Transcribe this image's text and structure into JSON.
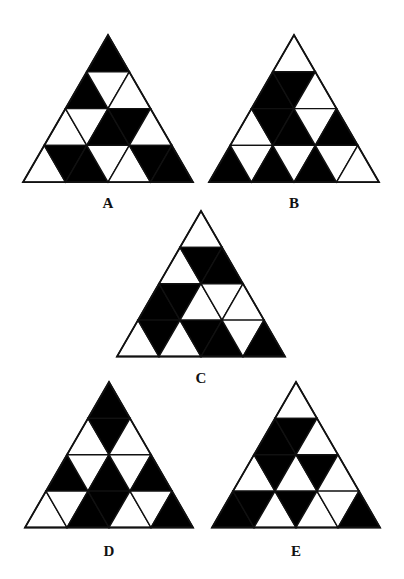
{
  "figures": [
    {
      "label": "A",
      "apex": [
        108,
        35
      ],
      "side": 170,
      "label_pos": [
        108,
        205
      ],
      "cells": [
        {
          "r": 0,
          "i": 0,
          "b": 1
        },
        {
          "r": 1,
          "i": 0,
          "b": 1
        },
        {
          "r": 1,
          "i": 1,
          "b": 0
        },
        {
          "r": 1,
          "i": 2,
          "b": 0
        },
        {
          "r": 2,
          "i": 0,
          "b": 0
        },
        {
          "r": 2,
          "i": 1,
          "b": 0
        },
        {
          "r": 2,
          "i": 2,
          "b": 1
        },
        {
          "r": 2,
          "i": 3,
          "b": 1
        },
        {
          "r": 2,
          "i": 4,
          "b": 0
        },
        {
          "r": 3,
          "i": 0,
          "b": 0
        },
        {
          "r": 3,
          "i": 1,
          "b": 1
        },
        {
          "r": 3,
          "i": 2,
          "b": 1
        },
        {
          "r": 3,
          "i": 3,
          "b": 0
        },
        {
          "r": 3,
          "i": 4,
          "b": 0
        },
        {
          "r": 3,
          "i": 5,
          "b": 1
        },
        {
          "r": 3,
          "i": 6,
          "b": 1
        }
      ]
    },
    {
      "label": "B",
      "apex": [
        294,
        35
      ],
      "side": 170,
      "label_pos": [
        294,
        205
      ],
      "cells": [
        {
          "r": 0,
          "i": 0,
          "b": 0
        },
        {
          "r": 1,
          "i": 0,
          "b": 1
        },
        {
          "r": 1,
          "i": 1,
          "b": 1
        },
        {
          "r": 1,
          "i": 2,
          "b": 0
        },
        {
          "r": 2,
          "i": 0,
          "b": 0
        },
        {
          "r": 2,
          "i": 1,
          "b": 1
        },
        {
          "r": 2,
          "i": 2,
          "b": 1
        },
        {
          "r": 2,
          "i": 3,
          "b": 0
        },
        {
          "r": 2,
          "i": 4,
          "b": 1
        },
        {
          "r": 3,
          "i": 0,
          "b": 1
        },
        {
          "r": 3,
          "i": 1,
          "b": 0
        },
        {
          "r": 3,
          "i": 2,
          "b": 1
        },
        {
          "r": 3,
          "i": 3,
          "b": 0
        },
        {
          "r": 3,
          "i": 4,
          "b": 1
        },
        {
          "r": 3,
          "i": 5,
          "b": 0
        },
        {
          "r": 3,
          "i": 6,
          "b": 0
        }
      ]
    },
    {
      "label": "C",
      "apex": [
        201,
        211
      ],
      "side": 168,
      "label_pos": [
        201,
        380
      ],
      "cells": [
        {
          "r": 0,
          "i": 0,
          "b": 0
        },
        {
          "r": 1,
          "i": 0,
          "b": 0
        },
        {
          "r": 1,
          "i": 1,
          "b": 1
        },
        {
          "r": 1,
          "i": 2,
          "b": 1
        },
        {
          "r": 2,
          "i": 0,
          "b": 1
        },
        {
          "r": 2,
          "i": 1,
          "b": 1
        },
        {
          "r": 2,
          "i": 2,
          "b": 0
        },
        {
          "r": 2,
          "i": 3,
          "b": 0
        },
        {
          "r": 2,
          "i": 4,
          "b": 0
        },
        {
          "r": 3,
          "i": 0,
          "b": 0
        },
        {
          "r": 3,
          "i": 1,
          "b": 1
        },
        {
          "r": 3,
          "i": 2,
          "b": 0
        },
        {
          "r": 3,
          "i": 3,
          "b": 1
        },
        {
          "r": 3,
          "i": 4,
          "b": 1
        },
        {
          "r": 3,
          "i": 5,
          "b": 0
        },
        {
          "r": 3,
          "i": 6,
          "b": 1
        }
      ]
    },
    {
      "label": "D",
      "apex": [
        109,
        382
      ],
      "side": 168,
      "label_pos": [
        109,
        553
      ],
      "cells": [
        {
          "r": 0,
          "i": 0,
          "b": 1
        },
        {
          "r": 1,
          "i": 0,
          "b": 0
        },
        {
          "r": 1,
          "i": 1,
          "b": 1
        },
        {
          "r": 1,
          "i": 2,
          "b": 0
        },
        {
          "r": 2,
          "i": 0,
          "b": 1
        },
        {
          "r": 2,
          "i": 1,
          "b": 0
        },
        {
          "r": 2,
          "i": 2,
          "b": 1
        },
        {
          "r": 2,
          "i": 3,
          "b": 0
        },
        {
          "r": 2,
          "i": 4,
          "b": 1
        },
        {
          "r": 3,
          "i": 0,
          "b": 0
        },
        {
          "r": 3,
          "i": 1,
          "b": 0
        },
        {
          "r": 3,
          "i": 2,
          "b": 1
        },
        {
          "r": 3,
          "i": 3,
          "b": 1
        },
        {
          "r": 3,
          "i": 4,
          "b": 0
        },
        {
          "r": 3,
          "i": 5,
          "b": 0
        },
        {
          "r": 3,
          "i": 6,
          "b": 1
        }
      ]
    },
    {
      "label": "E",
      "apex": [
        296,
        382
      ],
      "side": 168,
      "label_pos": [
        296,
        553
      ],
      "cells": [
        {
          "r": 0,
          "i": 0,
          "b": 0
        },
        {
          "r": 1,
          "i": 0,
          "b": 1
        },
        {
          "r": 1,
          "i": 1,
          "b": 1
        },
        {
          "r": 1,
          "i": 2,
          "b": 0
        },
        {
          "r": 2,
          "i": 0,
          "b": 0
        },
        {
          "r": 2,
          "i": 1,
          "b": 1
        },
        {
          "r": 2,
          "i": 2,
          "b": 0
        },
        {
          "r": 2,
          "i": 3,
          "b": 1
        },
        {
          "r": 2,
          "i": 4,
          "b": 0
        },
        {
          "r": 3,
          "i": 0,
          "b": 1
        },
        {
          "r": 3,
          "i": 1,
          "b": 1
        },
        {
          "r": 3,
          "i": 2,
          "b": 0
        },
        {
          "r": 3,
          "i": 3,
          "b": 1
        },
        {
          "r": 3,
          "i": 4,
          "b": 0
        },
        {
          "r": 3,
          "i": 5,
          "b": 0
        },
        {
          "r": 3,
          "i": 6,
          "b": 1
        }
      ]
    }
  ],
  "colors": {
    "fill_on": "#000000",
    "fill_off": "#ffffff",
    "stroke": "#111111"
  }
}
